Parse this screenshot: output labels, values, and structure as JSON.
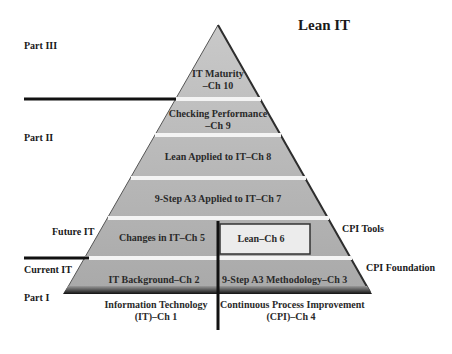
{
  "title": "Lean IT",
  "side_labels": {
    "part3": "Part III",
    "part2": "Part II",
    "part1": "Part I",
    "future_it": "Future IT",
    "current_it": "Current IT",
    "cpi_tools": "CPI Tools",
    "cpi_foundation": "CPI Foundation"
  },
  "pyramid": {
    "levels": [
      {
        "line1": "IT Maturity",
        "line2": "–Ch 10"
      },
      {
        "line1": "Checking Performance",
        "line2": "–Ch 9"
      },
      {
        "line1": "Lean Applied to IT–Ch 8"
      },
      {
        "line1": "9-Step A3 Applied to IT–Ch 7"
      },
      {
        "left": "Changes in IT–Ch 5",
        "right": "Lean–Ch 6"
      },
      {
        "left": "IT Background–Ch 2",
        "right": "9-Step A3 Methodology–Ch 3"
      }
    ],
    "foundation": {
      "left_line1": "Information Technology",
      "left_line2": "(IT)–Ch 1",
      "right_line1": "Continuous Process Improvement",
      "right_line2": "(CPI)–Ch 4"
    }
  },
  "colors": {
    "band_fill": "#b8b8b8",
    "separator": "#f2f2f2",
    "edge": "#3a3a3a",
    "divider": "#111111"
  }
}
